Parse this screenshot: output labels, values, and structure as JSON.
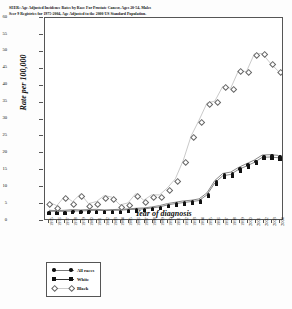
{
  "chart_data": {
    "type": "line",
    "title": "SEER: Age Adjusted Incidence Rates by Race For Prostate Cancer,  Ages 20-54, Males",
    "subtitle": "Seer 9 Registries for 1975-2004, Age Adjusted to the 2000 US Standard Population.",
    "xlabel": "Year of diagnosis",
    "ylabel": "Rate per 100,000",
    "ylim": [
      0,
      60
    ],
    "yticks": [
      0,
      5,
      10,
      15,
      20,
      25,
      30,
      35,
      40,
      45,
      50,
      55,
      60
    ],
    "grid": false,
    "legend_position": "bottom-left",
    "categories": [
      "1975",
      "1976",
      "1977",
      "1978",
      "1979",
      "1980",
      "1981",
      "1982",
      "1983",
      "1984",
      "1985",
      "1986",
      "1987",
      "1988",
      "1989",
      "1990",
      "1991",
      "1992",
      "1993",
      "1994",
      "1995",
      "1996",
      "1997",
      "1998",
      "1999",
      "2000",
      "2001",
      "2002",
      "2003",
      "2004"
    ],
    "series": [
      {
        "name": "All races",
        "marker": "filled-circle",
        "values": [
          2.6,
          2.5,
          2.6,
          2.8,
          2.7,
          2.8,
          2.9,
          2.7,
          2.8,
          2.9,
          3.0,
          3.2,
          3.3,
          3.6,
          4.0,
          4.6,
          5.0,
          5.4,
          5.6,
          6.0,
          7.8,
          11.5,
          13.6,
          14.0,
          15.4,
          16.5,
          17.6,
          19.1,
          19.2,
          19.0
        ]
      },
      {
        "name": "White",
        "marker": "filled-square",
        "values": [
          2.3,
          2.3,
          2.3,
          2.4,
          2.4,
          2.5,
          2.6,
          2.5,
          2.6,
          2.6,
          2.8,
          2.9,
          3.0,
          3.3,
          3.6,
          4.2,
          4.6,
          4.9,
          5.2,
          5.5,
          7.2,
          10.8,
          12.9,
          13.3,
          14.8,
          15.8,
          16.9,
          18.4,
          18.5,
          18.3
        ]
      },
      {
        "name": "Black",
        "marker": "open-diamond",
        "values": [
          5.0,
          4.0,
          6.8,
          5.2,
          7.5,
          4.6,
          5.2,
          7.0,
          6.5,
          4.2,
          4.8,
          7.6,
          5.6,
          7.2,
          7.2,
          9.3,
          12.0,
          17.5,
          24.8,
          29.5,
          34.6,
          35.2,
          39.6,
          39.0,
          44.3,
          44.0,
          49.3,
          49.4,
          46.6,
          44.2
        ]
      }
    ]
  },
  "legend": {
    "items": [
      {
        "label": "All races"
      },
      {
        "label": "White"
      },
      {
        "label": "Black"
      }
    ]
  },
  "colors": {
    "marker": "#111111",
    "line": "#777777",
    "frame": "#555555"
  }
}
